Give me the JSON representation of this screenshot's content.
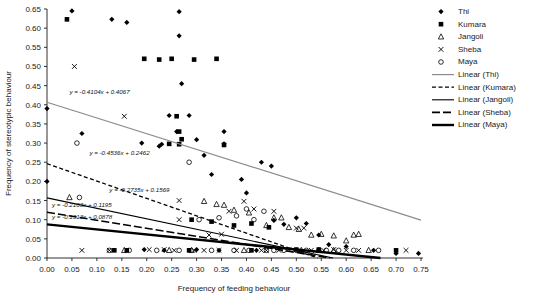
{
  "chart_data": {
    "type": "scatter",
    "title": "",
    "xlabel": "Frequency of feeding behaviour",
    "ylabel": "Frequency of stereotypic behaviour",
    "xlim": [
      0.0,
      0.75
    ],
    "ylim": [
      0.0,
      0.65
    ],
    "xticks": [
      "0.00",
      "0.05",
      "0.10",
      "0.15",
      "0.20",
      "0.25",
      "0.30",
      "0.35",
      "0.40",
      "0.45",
      "0.50",
      "0.55",
      "0.60",
      "0.65",
      "0.70",
      "0.75"
    ],
    "yticks": [
      "0.00",
      "0.05",
      "0.10",
      "0.15",
      "0.20",
      "0.25",
      "0.30",
      "0.35",
      "0.40",
      "0.45",
      "0.50",
      "0.55",
      "0.60",
      "0.65"
    ],
    "grid": false,
    "legend_position": "right",
    "series": [
      {
        "name": "Thi",
        "marker": "diamond",
        "color": "#000000",
        "points": [
          [
            0.0,
            0.39
          ],
          [
            0.0,
            0.2
          ],
          [
            0.05,
            0.645
          ],
          [
            0.07,
            0.325
          ],
          [
            0.13,
            0.623
          ],
          [
            0.16,
            0.615
          ],
          [
            0.19,
            0.3
          ],
          [
            0.225,
            0.292
          ],
          [
            0.23,
            0.297
          ],
          [
            0.245,
            0.372
          ],
          [
            0.26,
            0.33
          ],
          [
            0.265,
            0.643
          ],
          [
            0.265,
            0.58
          ],
          [
            0.27,
            0.455
          ],
          [
            0.285,
            0.372
          ],
          [
            0.3,
            0.309
          ],
          [
            0.315,
            0.268
          ],
          [
            0.33,
            0.218
          ],
          [
            0.355,
            0.33
          ],
          [
            0.355,
            0.298
          ],
          [
            0.39,
            0.205
          ],
          [
            0.4,
            0.17
          ],
          [
            0.43,
            0.25
          ],
          [
            0.45,
            0.24
          ],
          [
            0.455,
            0.098
          ],
          [
            0.475,
            0.088
          ],
          [
            0.5,
            0.105
          ],
          [
            0.52,
            0.09
          ],
          [
            0.545,
            0.06
          ],
          [
            0.565,
            0.035
          ],
          [
            0.6,
            0.03
          ],
          [
            0.655,
            0.02
          ],
          [
            0.7,
            0.012
          ],
          [
            0.745,
            0.012
          ],
          [
            0.195,
            0.022
          ],
          [
            0.235,
            0.02
          ],
          [
            0.3,
            0.022
          ],
          [
            0.345,
            0.02
          ],
          [
            0.42,
            0.02
          ]
        ]
      },
      {
        "name": "Kumara",
        "marker": "square",
        "color": "#000000",
        "points": [
          [
            0.04,
            0.623
          ],
          [
            0.195,
            0.52
          ],
          [
            0.225,
            0.518
          ],
          [
            0.25,
            0.52
          ],
          [
            0.245,
            0.298
          ],
          [
            0.26,
            0.37
          ],
          [
            0.265,
            0.33
          ],
          [
            0.27,
            0.31
          ],
          [
            0.295,
            0.518
          ],
          [
            0.34,
            0.52
          ],
          [
            0.355,
            0.295
          ],
          [
            0.29,
            0.1
          ],
          [
            0.33,
            0.095
          ],
          [
            0.375,
            0.085
          ],
          [
            0.41,
            0.09
          ],
          [
            0.445,
            0.08
          ],
          [
            0.265,
            0.297
          ],
          [
            0.135,
            0.02
          ],
          [
            0.16,
            0.02
          ],
          [
            0.285,
            0.02
          ],
          [
            0.41,
            0.02
          ],
          [
            0.5,
            0.022
          ],
          [
            0.545,
            0.022
          ],
          [
            0.7,
            0.02
          ]
        ]
      },
      {
        "name": "Jangoli",
        "marker": "triangle",
        "color": "#000000",
        "points": [
          [
            0.045,
            0.158
          ],
          [
            0.155,
            0.02
          ],
          [
            0.245,
            0.02
          ],
          [
            0.29,
            0.02
          ],
          [
            0.315,
            0.148
          ],
          [
            0.34,
            0.14
          ],
          [
            0.355,
            0.138
          ],
          [
            0.375,
            0.125
          ],
          [
            0.395,
            0.02
          ],
          [
            0.405,
            0.118
          ],
          [
            0.44,
            0.085
          ],
          [
            0.455,
            0.105
          ],
          [
            0.47,
            0.105
          ],
          [
            0.485,
            0.08
          ],
          [
            0.505,
            0.075
          ],
          [
            0.53,
            0.06
          ],
          [
            0.55,
            0.062
          ],
          [
            0.575,
            0.02
          ],
          [
            0.6,
            0.045
          ],
          [
            0.615,
            0.06
          ],
          [
            0.625,
            0.062
          ],
          [
            0.645,
            0.02
          ],
          [
            0.51,
            0.02
          ],
          [
            0.545,
            0.02
          ],
          [
            0.575,
            0.058
          ]
        ]
      },
      {
        "name": "Sheba",
        "marker": "cross",
        "color": "#000000",
        "points": [
          [
            0.055,
            0.5
          ],
          [
            0.155,
            0.37
          ],
          [
            0.07,
            0.02
          ],
          [
            0.125,
            0.02
          ],
          [
            0.205,
            0.022
          ],
          [
            0.235,
            0.022
          ],
          [
            0.255,
            0.02
          ],
          [
            0.265,
            0.1
          ],
          [
            0.295,
            0.02
          ],
          [
            0.315,
            0.02
          ],
          [
            0.325,
            0.06
          ],
          [
            0.345,
            0.02
          ],
          [
            0.35,
            0.062
          ],
          [
            0.365,
            0.122
          ],
          [
            0.38,
            0.02
          ],
          [
            0.395,
            0.148
          ],
          [
            0.415,
            0.128
          ],
          [
            0.43,
            0.02
          ],
          [
            0.44,
            0.02
          ],
          [
            0.455,
            0.122
          ],
          [
            0.465,
            0.02
          ],
          [
            0.485,
            0.022
          ],
          [
            0.5,
            0.078
          ],
          [
            0.515,
            0.078
          ],
          [
            0.53,
            0.02
          ],
          [
            0.555,
            0.02
          ],
          [
            0.575,
            0.022
          ],
          [
            0.6,
            0.02
          ],
          [
            0.625,
            0.02
          ],
          [
            0.72,
            0.02
          ],
          [
            0.265,
            0.15
          ]
        ]
      },
      {
        "name": "Maya",
        "marker": "circle",
        "color": "#000000",
        "points": [
          [
            0.06,
            0.3
          ],
          [
            0.065,
            0.158
          ],
          [
            0.125,
            0.02
          ],
          [
            0.165,
            0.02
          ],
          [
            0.22,
            0.02
          ],
          [
            0.265,
            0.02
          ],
          [
            0.285,
            0.25
          ],
          [
            0.305,
            0.1
          ],
          [
            0.33,
            0.02
          ],
          [
            0.345,
            0.105
          ],
          [
            0.375,
            0.02
          ],
          [
            0.38,
            0.11
          ],
          [
            0.4,
            0.128
          ],
          [
            0.415,
            0.1
          ],
          [
            0.435,
            0.122
          ],
          [
            0.455,
            0.02
          ],
          [
            0.475,
            0.02
          ],
          [
            0.5,
            0.02
          ],
          [
            0.52,
            0.02
          ],
          [
            0.545,
            0.02
          ],
          [
            0.56,
            0.02
          ],
          [
            0.585,
            0.02
          ],
          [
            0.615,
            0.02
          ],
          [
            0.665,
            0.02
          ],
          [
            0.44,
            0.02
          ],
          [
            0.405,
            0.02
          ]
        ]
      }
    ],
    "trendlines": [
      {
        "name": "Linear (Thi)",
        "equation": "y = -0.4104x + 0.4067",
        "slope": -0.4104,
        "intercept": 0.4067,
        "style": "solid-gray",
        "color": "#888888",
        "label_x": 0.045,
        "label_y": 0.428
      },
      {
        "name": "Linear (Kumara)",
        "equation": "y = -0.4536x + 0.2462",
        "slope": -0.4536,
        "intercept": 0.2462,
        "style": "dashed",
        "color": "#000000",
        "label_x": 0.085,
        "label_y": 0.268
      },
      {
        "name": "Linear (Jangoli)",
        "equation": "y = -0.2735x + 0.1569",
        "slope": -0.2735,
        "intercept": 0.1569,
        "style": "solid-thin",
        "color": "#000000",
        "label_x": 0.125,
        "label_y": 0.172
      },
      {
        "name": "Linear (Sheba)",
        "equation": "y = -0.2103x + 0.1195",
        "slope": -0.2103,
        "intercept": 0.1195,
        "style": "long-dash",
        "color": "#000000",
        "label_x": 0.01,
        "label_y": 0.134
      },
      {
        "name": "Linear (Maya)",
        "equation": "y = -0.1313x + 0.0878",
        "slope": -0.1313,
        "intercept": 0.0878,
        "style": "thick",
        "color": "#000000",
        "label_x": 0.01,
        "label_y": 0.102
      }
    ],
    "legend": [
      {
        "label": "Thi",
        "kind": "marker",
        "marker": "diamond"
      },
      {
        "label": "Kumara",
        "kind": "marker",
        "marker": "square"
      },
      {
        "label": "Jangoli",
        "kind": "marker",
        "marker": "triangle"
      },
      {
        "label": "Sheba",
        "kind": "marker",
        "marker": "cross"
      },
      {
        "label": "Maya",
        "kind": "marker",
        "marker": "circle"
      },
      {
        "label": "Linear (Thi)",
        "kind": "line",
        "style": "solid-gray"
      },
      {
        "label": "Linear (Kumara)",
        "kind": "line",
        "style": "dashed"
      },
      {
        "label": "Linear (Jangoli)",
        "kind": "line",
        "style": "solid-thin"
      },
      {
        "label": "Linear (Sheba)",
        "kind": "line",
        "style": "long-dash"
      },
      {
        "label": "Linear (Maya)",
        "kind": "line",
        "style": "thick"
      }
    ]
  }
}
